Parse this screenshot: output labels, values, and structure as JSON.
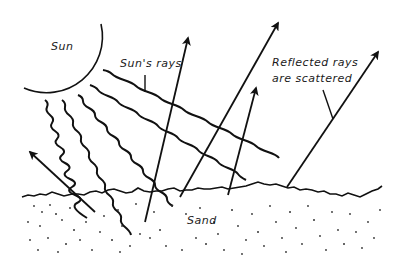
{
  "diagram": {
    "labels": {
      "sun": "Sun",
      "suns_rays": "Sun's rays",
      "reflected_line1": "Reflected rays",
      "reflected_line2": "are scattered",
      "sand": "Sand"
    },
    "colors": {
      "ink": "#111111",
      "background": "#ffffff",
      "sand_dots": "#333333"
    }
  }
}
